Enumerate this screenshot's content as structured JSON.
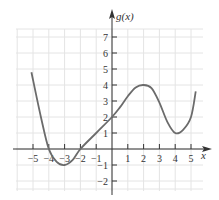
{
  "chart_data": {
    "type": "line",
    "title": "",
    "xlabel": "x",
    "ylabel": "g(x)",
    "xlim": [
      -5.5,
      5.5
    ],
    "ylim": [
      -2.5,
      7.5
    ],
    "x_ticks": [
      -5,
      -4,
      -3,
      -2,
      -1,
      1,
      2,
      3,
      4,
      5
    ],
    "y_ticks": [
      -2,
      -1,
      1,
      2,
      3,
      4,
      5,
      6,
      7
    ],
    "grid": true,
    "legend": "none",
    "series": [
      {
        "name": "g(x)",
        "x": [
          -5.1,
          -4.5,
          -4,
          -3.5,
          -3,
          -2.5,
          -2,
          -1,
          0,
          0.5,
          1,
          1.5,
          2,
          2.5,
          3,
          3.5,
          4,
          4.5,
          5,
          5.3
        ],
        "values": [
          4.8,
          2.0,
          0,
          -0.8,
          -1,
          -0.7,
          0,
          1,
          2,
          2.6,
          3.3,
          3.85,
          4,
          3.8,
          2.9,
          1.7,
          1,
          1.2,
          2.0,
          3.6
        ]
      }
    ],
    "key_points": {
      "zeros": [
        -4,
        -2
      ],
      "local_min": [
        [
          -3,
          -1
        ],
        [
          4,
          1
        ]
      ],
      "local_max": [
        [
          2,
          4
        ]
      ],
      "y_intercept": 2
    }
  },
  "labels": {
    "x_axis": "x",
    "y_axis": "g(x)"
  },
  "colors": {
    "curve": "#6b6b6b",
    "axis": "#333333",
    "grid": "#e4e4e4"
  }
}
